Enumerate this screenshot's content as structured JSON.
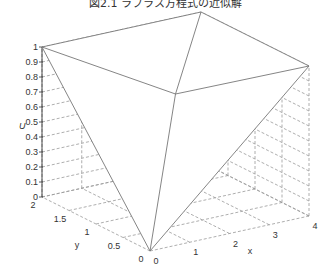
{
  "chart_data": {
    "type": "surface3d",
    "title": "図2.1 ラプラス方程式の近似解",
    "xlabel": "x",
    "ylabel": "y",
    "zlabel": "U",
    "xlim": [
      0,
      4
    ],
    "ylim": [
      0,
      2
    ],
    "zlim": [
      0,
      1
    ],
    "x_ticks": [
      "0",
      "1",
      "2",
      "3",
      "4"
    ],
    "y_ticks": [
      "0",
      "0.5",
      "1",
      "1.5",
      "2"
    ],
    "z_ticks": [
      "0",
      "0.1",
      "0.2",
      "0.3",
      "0.4",
      "0.5",
      "0.6",
      "0.7",
      "0.8",
      "0.9",
      "1"
    ],
    "grid": true,
    "vertices": [
      {
        "x": 0,
        "y": 0,
        "U": 0
      },
      {
        "x": 4,
        "y": 0,
        "U": 1
      },
      {
        "x": 0,
        "y": 2,
        "U": 1
      },
      {
        "x": 4,
        "y": 2,
        "U": 1
      },
      {
        "x": 2,
        "y": 1,
        "U": 0.75
      }
    ],
    "mesh_edges": [
      [
        0,
        1
      ],
      [
        1,
        3
      ],
      [
        3,
        2
      ],
      [
        2,
        0
      ],
      [
        4,
        0
      ],
      [
        4,
        1
      ],
      [
        4,
        2
      ],
      [
        4,
        3
      ]
    ]
  },
  "colors": {
    "surface_edge": "#777777",
    "grid": "#999999",
    "axis": "#333333"
  }
}
